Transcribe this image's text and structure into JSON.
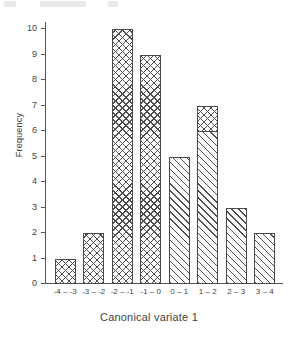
{
  "chart_data": {
    "type": "bar",
    "title": "",
    "subtitle": "",
    "xlabel": "Canonical variate 1",
    "ylabel": "Frequency",
    "categories": [
      "-4 – -3",
      "-3 – -2",
      "-2 – -1",
      "-1 – 0",
      "0 – 1",
      "1 – 2",
      "2 – 3",
      "3 – 4"
    ],
    "values": [
      1,
      2,
      10,
      9,
      5,
      7,
      3,
      2
    ],
    "series": [
      {
        "name": "group-1-crosshatch",
        "values": [
          1,
          2,
          10,
          9,
          0,
          1,
          0,
          0
        ]
      },
      {
        "name": "group-2-diagonal",
        "values": [
          0,
          0,
          0,
          0,
          5,
          6,
          3,
          2
        ]
      }
    ],
    "stacked": true,
    "ylim": [
      0,
      10
    ],
    "yticks": [
      "0",
      "1",
      "2",
      "3",
      "4",
      "5",
      "6",
      "7",
      "8",
      "9",
      "10"
    ],
    "grid": false,
    "legend": "none",
    "bar_fills": [
      "crosshatch",
      "crosshatch",
      "crosshatch",
      "crosshatch",
      "diagonal",
      "stacked",
      "diagonal",
      "diagonal"
    ],
    "colors": {
      "axis": "#555555",
      "bar_outline": "#4a4a4a",
      "hatch": "#4e4e4e",
      "bar_background": "#fdfdfd",
      "text": "#3f3f3f",
      "page_background": "#ffffff"
    }
  }
}
